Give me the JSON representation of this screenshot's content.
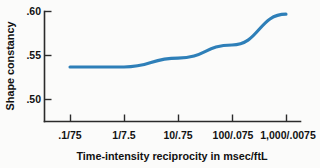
{
  "chart_data": {
    "type": "line",
    "title": "",
    "subtitle": "",
    "xlabel": "Time-intensity reciprocity in msec/ftL",
    "ylabel": "Shape constancy",
    "categories": [
      ".1/75",
      "1/7.5",
      "10/.75",
      "100/.075",
      "1,000/.0075"
    ],
    "values": [
      0.537,
      0.537,
      0.547,
      0.562,
      0.597
    ],
    "series": [
      {
        "name": "Shape constancy",
        "values": [
          0.537,
          0.537,
          0.547,
          0.562,
          0.597
        ],
        "color": "#2e7fb8"
      }
    ],
    "ylim": [
      0.468,
      0.6
    ],
    "yticks": [
      0.5,
      0.55,
      0.6
    ],
    "ytick_labels": [
      ".50",
      ".55",
      ".60"
    ],
    "xtick_labels": [
      ".1/75",
      "1/7.5",
      "10/.75",
      "100/.075",
      "1,000/.0075"
    ],
    "grid": false,
    "legend": false,
    "legend_position": "none",
    "line_color": "#2e7fb8",
    "axis_color": "#2b2b2b",
    "background_color": "#fbfbfa"
  }
}
